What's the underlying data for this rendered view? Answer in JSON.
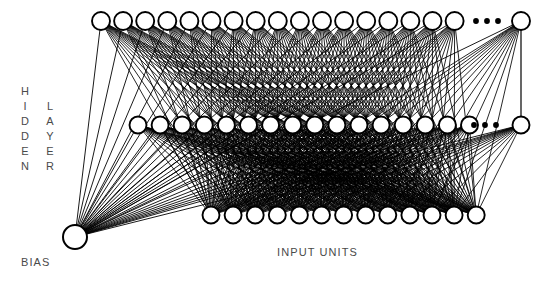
{
  "figure": {
    "type": "neural-network-architecture-diagram",
    "background_color": "#ffffff",
    "ink_color": "#000000",
    "text_color": "#4a4a4a",
    "width": 551,
    "height": 285
  },
  "labels": {
    "hidden": "HIDDEN",
    "layer": "LAYER",
    "bias": "BIAS",
    "input_units": "INPUT UNITS",
    "ellipsis": "•••"
  },
  "layers": {
    "hidden_top": {
      "name": "hidden-layer-top-row",
      "visible_node_count": 17,
      "has_ellipsis": true,
      "trailing_node_count": 1,
      "y": 21,
      "x_start": 101,
      "x_step": 22.1,
      "radius": 9,
      "ellipsis_x": 487,
      "last_node_x": 521
    },
    "hidden_middle": {
      "name": "hidden-layer-middle-row",
      "visible_node_count": 16,
      "has_ellipsis": true,
      "trailing_node_count": 1,
      "y": 125,
      "x_start": 138,
      "x_step": 22.1,
      "radius": 8.5,
      "ellipsis_x": 485,
      "last_node_x": 521
    },
    "input": {
      "name": "input-units-row",
      "visible_node_count": 13,
      "has_ellipsis": false,
      "y": 215,
      "x_start": 211,
      "x_step": 22.1,
      "radius": 8.5
    },
    "bias": {
      "name": "bias-node",
      "x": 75,
      "y": 237,
      "radius": 12
    }
  },
  "connections": {
    "bias_to_hidden_top": true,
    "bias_to_hidden_middle": true,
    "input_to_hidden_top": true,
    "input_to_hidden_middle": true,
    "hidden_top_to_hidden_middle": false,
    "tail_node_vertical_link": true
  },
  "chart_data": {
    "type": "diagram",
    "title": "",
    "node_rows": [
      {
        "row": "hidden_top",
        "count": 18,
        "label": "HIDDEN LAYER"
      },
      {
        "row": "hidden_middle",
        "count": 17,
        "label": "HIDDEN LAYER"
      },
      {
        "row": "input",
        "count": 13,
        "label": "INPUT UNITS"
      },
      {
        "row": "bias",
        "count": 1,
        "label": "BIAS"
      }
    ]
  }
}
